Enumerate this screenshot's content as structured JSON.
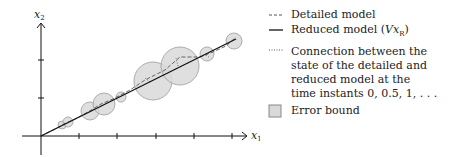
{
  "axes": {
    "x_label": "x",
    "x_sub": "1",
    "y_label": "x",
    "y_sub": "2"
  },
  "legend": {
    "items": [
      {
        "symbol": "dashed-line",
        "label": "Detailed model"
      },
      {
        "symbol": "solid-line",
        "label": "Reduced model (Vx_R)"
      },
      {
        "symbol": "dotted-line",
        "label": "Connection between the\nstate of the detailed and\nreduced model at the\ntime instants 0, 0.5, 1, . . ."
      },
      {
        "symbol": "gray-box",
        "label": "Error bound"
      }
    ]
  },
  "colors": {
    "circle_fill": "#d9d9d9",
    "circle_stroke": "#9a9a9a",
    "line": "#111111"
  },
  "diagram": {
    "origin": [
      41,
      136
    ],
    "x_ticks_px": [
      79,
      117,
      156,
      194,
      232
    ],
    "y_ticks_px": [
      98,
      60
    ],
    "reduced_line": [
      [
        41,
        136
      ],
      [
        236,
        39
      ]
    ],
    "error_circles": [
      {
        "cx": 62,
        "cy": 125,
        "r": 4
      },
      {
        "cx": 68,
        "cy": 122,
        "r": 5
      },
      {
        "cx": 90,
        "cy": 111,
        "r": 9
      },
      {
        "cx": 104,
        "cy": 104,
        "r": 11
      },
      {
        "cx": 121,
        "cy": 97,
        "r": 5
      },
      {
        "cx": 153,
        "cy": 81,
        "r": 19
      },
      {
        "cx": 180,
        "cy": 66,
        "r": 19
      },
      {
        "cx": 207,
        "cy": 54,
        "r": 7
      },
      {
        "cx": 234,
        "cy": 41,
        "r": 8
      }
    ]
  }
}
